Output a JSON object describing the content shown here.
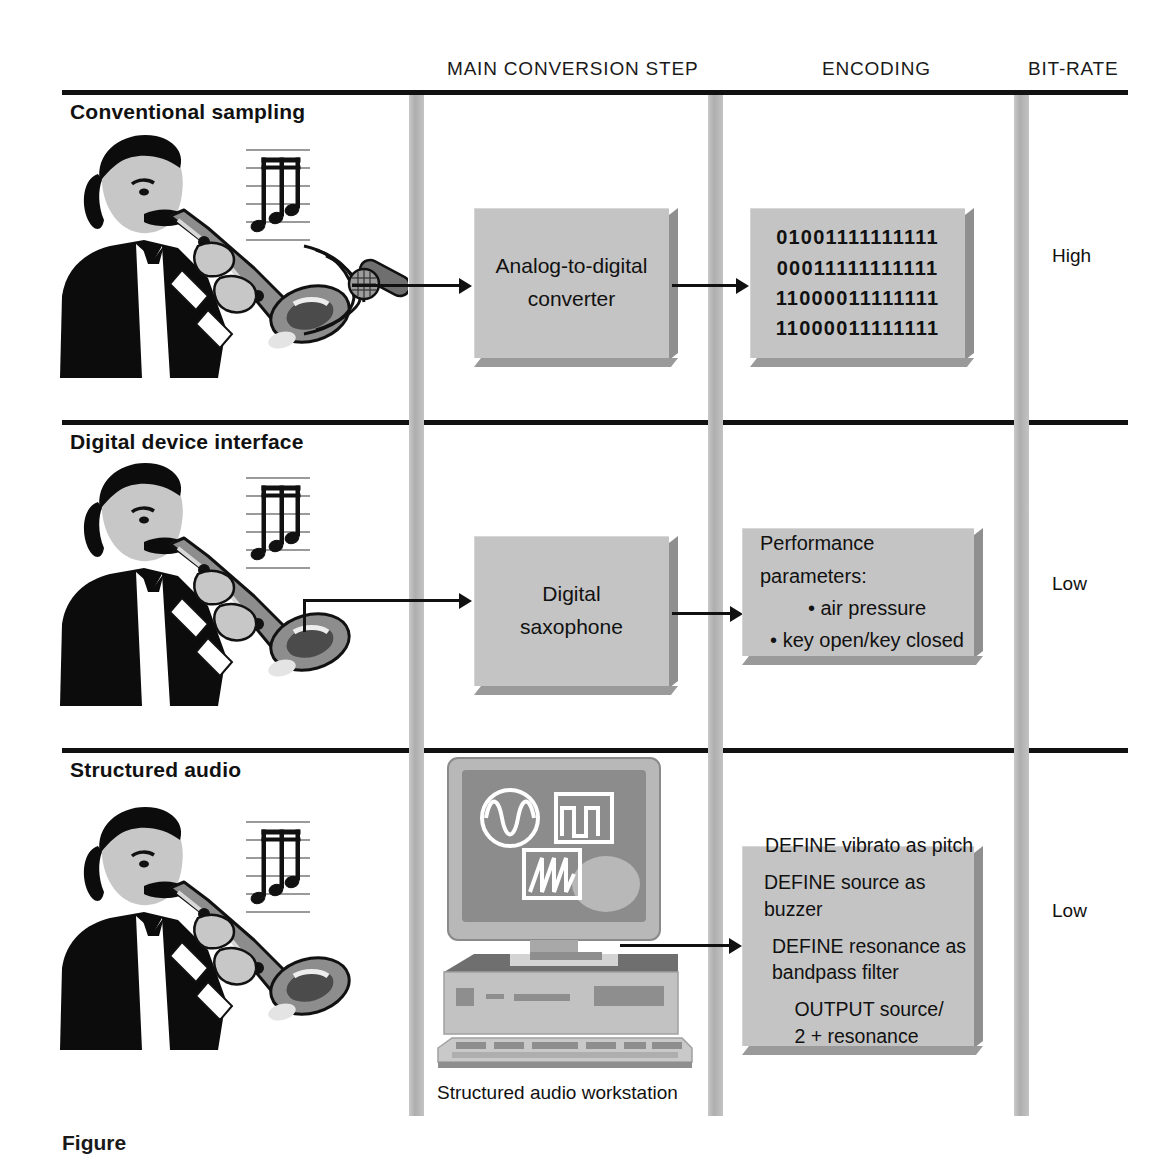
{
  "figure": {
    "columns": [
      {
        "key": "main_conversion_step",
        "label": "MAIN CONVERSION STEP"
      },
      {
        "key": "encoding",
        "label": "ENCODING"
      },
      {
        "key": "bit_rate",
        "label": "BIT-RATE"
      }
    ],
    "rows": [
      {
        "key": "conventional_sampling",
        "title": "Conventional sampling",
        "source_icon": "saxophonist-with-microphone",
        "conversion_box": {
          "lines": [
            "Analog-to-digital",
            "converter"
          ]
        },
        "encoding_box": {
          "type": "binary",
          "lines": [
            "01001111111111",
            "00011111111111",
            "11000011111111",
            "11000011111111"
          ]
        },
        "bit_rate": "High"
      },
      {
        "key": "digital_device_interface",
        "title": "Digital device interface",
        "source_icon": "saxophonist-with-cable",
        "conversion_box": {
          "lines": [
            "Digital",
            "saxophone"
          ]
        },
        "encoding_box": {
          "type": "parameters",
          "heading": "Performance parameters:",
          "items": [
            "air pressure",
            "key open/key closed"
          ]
        },
        "bit_rate": "Low"
      },
      {
        "key": "structured_audio",
        "title": "Structured audio",
        "source_icon": "saxophonist",
        "conversion_box": {
          "type": "workstation",
          "caption": "Structured audio workstation",
          "screen_icons": [
            "sine-wave-icon",
            "square-wave-icon",
            "sawtooth-wave-icon"
          ]
        },
        "encoding_box": {
          "type": "code",
          "lines": [
            "DEFINE vibrato as pitch",
            "DEFINE source as buzzer",
            "DEFINE resonance as\n            bandpass filter",
            "OUTPUT source/\n        2 + resonance"
          ]
        },
        "bit_rate": "Low"
      }
    ],
    "caption": {
      "label": "Figure",
      "number": "",
      "text": ""
    },
    "colors": {
      "box_fill": "#c4c4c4",
      "box_shadow": "#8f8f8f",
      "rule": "#111111",
      "column_bar": "#b4b4b4",
      "screen": "#8c8c8c"
    }
  }
}
